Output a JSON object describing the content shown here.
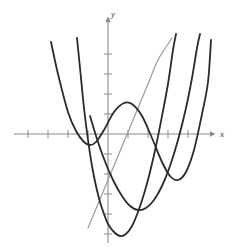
{
  "figure": {
    "title": "",
    "background_color": "#ffffff",
    "width": 237,
    "height": 250
  },
  "axes": {
    "x_axis_label": "x",
    "y_axis_label": "y",
    "axis_color": "#8a8a8a",
    "origin_px": [
      108,
      134
    ],
    "unit_px": 20,
    "x_tick_values": [
      -4,
      -3,
      -2,
      -1,
      1,
      2,
      3,
      4
    ],
    "y_tick_values": [
      4,
      3,
      2,
      1,
      -1,
      -2,
      -3,
      -4,
      -5
    ],
    "x_range": [
      -4.8,
      5.2
    ],
    "y_range": [
      -5.6,
      5.4
    ],
    "grid": false,
    "arrow_x": true,
    "arrow_y": true
  },
  "chart_data": {
    "type": "line",
    "title": "",
    "xlabel": "x",
    "ylabel": "y",
    "grid": false,
    "legend": "none",
    "xlim": [
      -4.8,
      5.2
    ],
    "ylim": [
      -5.6,
      5.4
    ],
    "series": [
      {
        "name": "linear-line",
        "color": "#9a9a9a",
        "width": 1.2,
        "type": "line",
        "points": [
          [
            -1.0,
            -4.7
          ],
          [
            -0.5,
            -3.5
          ],
          [
            0.0,
            -2.3
          ],
          [
            0.5,
            -1.1
          ],
          [
            1.0,
            0.1
          ],
          [
            1.5,
            1.3
          ],
          [
            2.0,
            2.5
          ],
          [
            2.5,
            3.7
          ],
          [
            3.2,
            4.8
          ]
        ]
      },
      {
        "name": "cubic-curve",
        "color": "#2b2b2b",
        "width": 1.8,
        "type": "line",
        "points": [
          [
            -2.85,
            4.6
          ],
          [
            -2.5,
            3.0
          ],
          [
            -2.0,
            1.1
          ],
          [
            -1.6,
            0.15
          ],
          [
            -1.2,
            -0.4
          ],
          [
            -0.9,
            -0.55
          ],
          [
            -0.6,
            -0.4
          ],
          [
            -0.2,
            0.2
          ],
          [
            0.3,
            1.1
          ],
          [
            0.8,
            1.55
          ],
          [
            1.2,
            1.5
          ],
          [
            1.7,
            0.9
          ],
          [
            2.2,
            -0.2
          ],
          [
            2.7,
            -1.4
          ],
          [
            3.1,
            -2.1
          ],
          [
            3.5,
            -2.3
          ],
          [
            3.9,
            -1.9
          ],
          [
            4.3,
            -0.8
          ],
          [
            4.7,
            1.0
          ],
          [
            5.0,
            2.6
          ],
          [
            5.15,
            4.7
          ]
        ]
      },
      {
        "name": "parabola-left",
        "color": "#2b2b2b",
        "width": 1.8,
        "type": "line",
        "points": [
          [
            -1.55,
            4.8
          ],
          [
            -1.4,
            3.3
          ],
          [
            -1.2,
            1.3
          ],
          [
            -1.0,
            -0.3
          ],
          [
            -0.8,
            -1.6
          ],
          [
            -0.6,
            -2.6
          ],
          [
            -0.4,
            -3.4
          ],
          [
            -0.2,
            -4.0
          ],
          [
            0.0,
            -4.5
          ],
          [
            0.3,
            -4.9
          ],
          [
            0.6,
            -5.1
          ],
          [
            0.9,
            -5.0
          ],
          [
            1.2,
            -4.6
          ],
          [
            1.5,
            -3.9
          ],
          [
            1.8,
            -3.0
          ],
          [
            2.1,
            -1.9
          ],
          [
            2.4,
            -0.6
          ],
          [
            2.7,
            0.9
          ],
          [
            3.0,
            2.5
          ],
          [
            3.25,
            4.2
          ],
          [
            3.4,
            5.0
          ]
        ]
      },
      {
        "name": "parabola-right",
        "color": "#2b2b2b",
        "width": 1.8,
        "type": "line",
        "points": [
          [
            -0.9,
            0.9
          ],
          [
            -0.5,
            -0.4
          ],
          [
            -0.1,
            -1.5
          ],
          [
            0.3,
            -2.4
          ],
          [
            0.7,
            -3.1
          ],
          [
            1.1,
            -3.6
          ],
          [
            1.5,
            -3.8
          ],
          [
            1.9,
            -3.7
          ],
          [
            2.3,
            -3.3
          ],
          [
            2.7,
            -2.6
          ],
          [
            3.1,
            -1.6
          ],
          [
            3.5,
            -0.3
          ],
          [
            3.9,
            1.3
          ],
          [
            4.2,
            2.8
          ],
          [
            4.45,
            4.3
          ],
          [
            4.6,
            5.0
          ]
        ]
      }
    ]
  },
  "colors": {
    "curve_dark": "#2b2b2b",
    "line_gray": "#9a9a9a",
    "axis_gray": "#8a8a8a",
    "label_gray": "#3a3a3a",
    "background": "#ffffff"
  }
}
